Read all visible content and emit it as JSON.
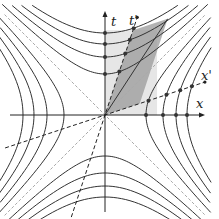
{
  "diagram": {
    "labels": {
      "t_axis": "t",
      "t_prime_axis": "t'",
      "x_axis": "x",
      "x_prime_axis": "x'"
    },
    "colors": {
      "curves": "#333333",
      "axes": "#222222",
      "light_cone": "#aaaaaa",
      "light_region": "#e6e6e6",
      "dark_region": "#999999",
      "dots": "#333333"
    },
    "origin": [
      105,
      115
    ],
    "unit_px": 41,
    "hyperbola_levels": [
      1,
      2,
      3,
      4
    ],
    "boost_velocity": 0.33
  }
}
